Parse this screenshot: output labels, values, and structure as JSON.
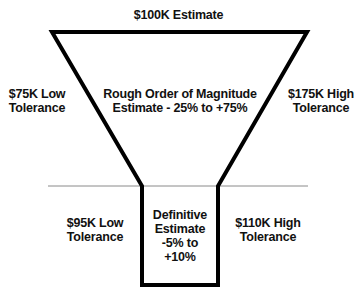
{
  "diagram": {
    "type": "funnel",
    "top_label": "$100K Estimate",
    "upper_section": {
      "left_label": [
        "$75K Low",
        "Tolerance"
      ],
      "center_label": [
        "Rough Order of Magnitude",
        "Estimate - 25% to +75%"
      ],
      "right_label": [
        "$175K High",
        "Tolerance"
      ]
    },
    "lower_section": {
      "left_label": [
        "$95K Low",
        "Tolerance"
      ],
      "center_label": [
        "Definitive",
        "Estimate",
        "-5% to",
        "+10%"
      ],
      "right_label": [
        "$110K High",
        "Tolerance"
      ]
    },
    "colors": {
      "outline": "#000000",
      "divider": "#8a8a8a",
      "text": "#111111",
      "background": "#ffffff"
    }
  }
}
